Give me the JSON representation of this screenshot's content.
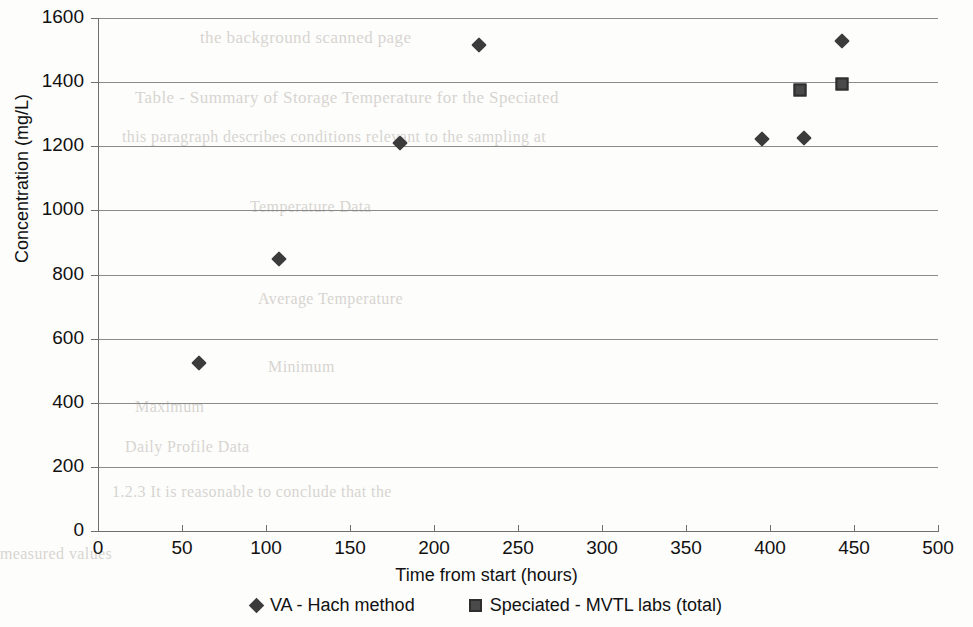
{
  "chart_data": {
    "type": "scatter",
    "title": "",
    "xlabel": "Time from start (hours)",
    "ylabel": "Concentration (mg/L)",
    "xlim": [
      0,
      500
    ],
    "ylim": [
      0,
      1600
    ],
    "xticks": [
      0,
      50,
      100,
      150,
      200,
      250,
      300,
      350,
      400,
      450,
      500
    ],
    "yticks": [
      0,
      200,
      400,
      600,
      800,
      1000,
      1200,
      1400,
      1600
    ],
    "grid": "horizontal",
    "legend_position": "bottom",
    "series": [
      {
        "name": "VA - Hach method",
        "marker": "diamond",
        "color": "#3b3b3b",
        "points": [
          {
            "x": 60,
            "y": 525
          },
          {
            "x": 108,
            "y": 848
          },
          {
            "x": 180,
            "y": 1210
          },
          {
            "x": 227,
            "y": 1515
          },
          {
            "x": 395,
            "y": 1222
          },
          {
            "x": 420,
            "y": 1225
          },
          {
            "x": 443,
            "y": 1528
          }
        ]
      },
      {
        "name": "Speciated - MVTL labs (total)",
        "marker": "square",
        "color": "#4a4a4a",
        "points": [
          {
            "x": 418,
            "y": 1375
          },
          {
            "x": 443,
            "y": 1395
          }
        ]
      }
    ]
  },
  "axes": {
    "y_tick_labels": [
      "1600",
      "1400",
      "1200",
      "1000",
      "800",
      "600",
      "400",
      "200",
      "0"
    ],
    "x_tick_labels": [
      "0",
      "50",
      "100",
      "150",
      "200",
      "250",
      "300",
      "350",
      "400",
      "450",
      "500"
    ],
    "x_title": "Time from start (hours)",
    "y_title": "Concentration (mg/L)"
  },
  "legend": {
    "items": [
      {
        "label": "VA - Hach method",
        "marker": "diamond-marker"
      },
      {
        "label": "Speciated - MVTL labs (total)",
        "marker": "square-marker"
      }
    ]
  },
  "background_text": {
    "lines": [
      "the background scanned page",
      "Table - Summary of Storage Temperature for the Speciated",
      "this paragraph describes conditions relevant to the sampling at",
      "Temperature Data",
      "Average Temperature",
      "Minimum",
      "Maximum",
      "Daily Profile Data",
      "1.2.3  It is reasonable to conclude that the",
      "measured values"
    ]
  }
}
